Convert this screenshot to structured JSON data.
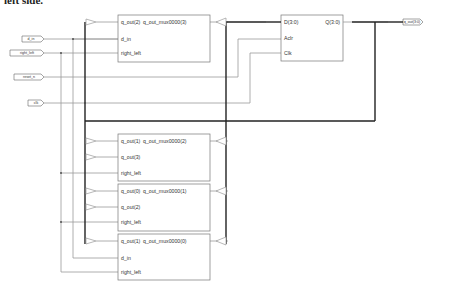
{
  "header": {
    "text": "left side."
  },
  "ports": {
    "inputs": [
      {
        "name": "d_in"
      },
      {
        "name": "right_left"
      },
      {
        "name": "reset_n"
      },
      {
        "name": "clk"
      }
    ],
    "outputs": [
      {
        "name": "q_out(3:0)"
      }
    ]
  },
  "blocks": {
    "mux3": {
      "pins": [
        "q_out(2)",
        "q_out_mux0000(3)",
        "d_in",
        "right_left"
      ]
    },
    "mux2": {
      "pins": [
        "q_out(1)",
        "q_out_mux0000(2)",
        "q_out(3)",
        "right_left"
      ]
    },
    "mux1": {
      "pins": [
        "q_out(0)",
        "q_out_mux0000(1)",
        "q_out(2)",
        "right_left"
      ]
    },
    "mux0": {
      "pins": [
        "q_out(1)",
        "q_out_mux0000(0)",
        "d_in",
        "right_left"
      ]
    },
    "register": {
      "pins": [
        "D(3:0)",
        "Q(3:0)",
        "Aclr",
        "Clk"
      ]
    }
  },
  "colors": {
    "wire": "#9a9a9a",
    "bus": "#222222",
    "block_border": "#777777"
  }
}
